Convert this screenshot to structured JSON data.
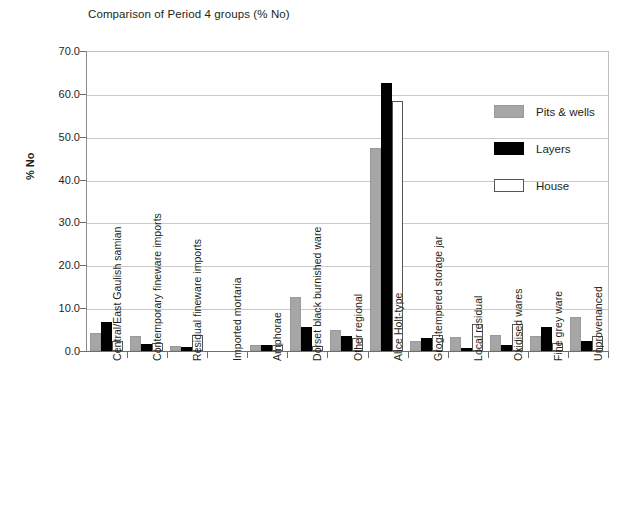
{
  "chart_data": {
    "type": "bar",
    "title": "Comparison of Period 4 groups (% No)",
    "xlabel": "",
    "ylabel": "% No",
    "ylim": [
      0,
      70
    ],
    "ytick_step": 10,
    "ytick_labels": [
      "70.0",
      "60.0",
      "50.0",
      "40.0",
      "30.0",
      "20.0",
      "10.0",
      "0.0"
    ],
    "ytick_values": [
      70,
      60,
      50,
      40,
      30,
      20,
      10,
      0
    ],
    "grid": true,
    "grid_axis": "y",
    "legend_position": "right",
    "categories": [
      "Central/East Gaulish samian",
      "Contemporary fineware imports",
      "Residual fineware imports",
      "Imported mortaria",
      "Amphorae",
      "Dorset black burnished ware",
      "Other regional",
      "Alice Holt-type",
      "Grog-tempered storage jar",
      "Local residual",
      "Oxidised wares",
      "Fine grey ware",
      "Unprovenanced"
    ],
    "series": [
      {
        "name": "Pits & wells",
        "color": "#a6a6a6",
        "values": [
          4.2,
          3.6,
          1.1,
          0.0,
          1.5,
          12.5,
          4.9,
          47.4,
          2.3,
          3.2,
          3.8,
          3.4,
          8.0
        ]
      },
      {
        "name": "Layers",
        "color": "#000000",
        "values": [
          6.8,
          1.7,
          0.9,
          0.0,
          1.5,
          5.5,
          3.5,
          62.5,
          3.0,
          0.6,
          1.4,
          5.7,
          2.3
        ]
      },
      {
        "name": "House",
        "color": "#ffffff",
        "values": [
          2.3,
          1.8,
          3.7,
          0.0,
          1.3,
          1.2,
          3.1,
          58.3,
          3.8,
          6.3,
          6.3,
          1.8,
          3.4
        ]
      }
    ]
  },
  "legend": {
    "items": [
      {
        "label": "Pits & wells",
        "swatch": "pits"
      },
      {
        "label": "Layers",
        "swatch": "layers"
      },
      {
        "label": "House",
        "swatch": "house"
      }
    ]
  }
}
